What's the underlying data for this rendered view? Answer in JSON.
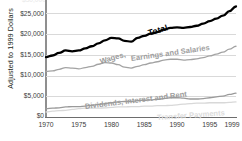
{
  "chart_data": {
    "type": "line",
    "title": "",
    "xlabel": "",
    "ylabel": "Adjusted to 1999 Dollars",
    "xlim": [
      1970,
      1999
    ],
    "ylim": [
      0,
      27000
    ],
    "grid": true,
    "legend_position": "inline-labels",
    "x_ticks": [
      "1970",
      "1975",
      "1980",
      "1985",
      "1990",
      "1995",
      "1999"
    ],
    "x_tick_values": [
      1970,
      1975,
      1980,
      1985,
      1990,
      1995,
      1999
    ],
    "y_ticks": [
      "$0",
      "$5,000",
      "$10,000",
      "$15,000",
      "$20,000",
      "$25,000"
    ],
    "y_tick_values": [
      0,
      5000,
      10000,
      15000,
      20000,
      25000
    ],
    "x": [
      1970,
      1971,
      1972,
      1973,
      1974,
      1975,
      1976,
      1977,
      1978,
      1979,
      1980,
      1981,
      1982,
      1983,
      1984,
      1985,
      1986,
      1987,
      1988,
      1989,
      1990,
      1991,
      1992,
      1993,
      1994,
      1995,
      1996,
      1997,
      1998,
      1999
    ],
    "series": [
      {
        "name": "Total",
        "color": "#000000",
        "width": 2.3,
        "values": [
          14300,
          14700,
          15300,
          15900,
          15700,
          15900,
          16400,
          16900,
          17600,
          18300,
          18900,
          18800,
          18200,
          18000,
          18900,
          19400,
          19900,
          20300,
          20900,
          21300,
          21400,
          21300,
          21500,
          21800,
          22300,
          22900,
          23500,
          24200,
          25300,
          26400
        ]
      },
      {
        "name": "Wages, Earnings and Salaries",
        "color": "#a3a3a3",
        "width": 1.3,
        "values": [
          10900,
          11000,
          11400,
          11800,
          11700,
          11500,
          11800,
          12100,
          12600,
          13000,
          12900,
          12500,
          11900,
          11700,
          12100,
          12500,
          12900,
          13200,
          13600,
          13800,
          13800,
          13600,
          13700,
          13900,
          14200,
          14600,
          15000,
          15500,
          16200,
          16900
        ]
      },
      {
        "name": "Dividends, Interest and Rent",
        "color": "#9a9a9a",
        "width": 1.3,
        "values": [
          2000,
          2100,
          2200,
          2400,
          2500,
          2500,
          2600,
          2800,
          3000,
          3200,
          3400,
          3600,
          3700,
          3700,
          3900,
          4000,
          4100,
          4200,
          4400,
          4600,
          4600,
          4500,
          4300,
          4300,
          4400,
          4600,
          4800,
          5000,
          5400,
          5700
        ]
      },
      {
        "name": "Transfer Payments",
        "color": "#d8d8d8",
        "width": 1.3,
        "values": [
          1200,
          1400,
          1500,
          1600,
          1800,
          2000,
          2100,
          2100,
          2100,
          2200,
          2300,
          2400,
          2400,
          2500,
          2500,
          2600,
          2600,
          2700,
          2700,
          2800,
          2900,
          3100,
          3200,
          3300,
          3300,
          3400,
          3400,
          3400,
          3500,
          3600
        ]
      }
    ],
    "annotations": [
      {
        "text": "Total",
        "series": "Total"
      },
      {
        "text": "Wages,",
        "series": "Wages, Earnings and Salaries"
      },
      {
        "text": "Earnings and Salaries",
        "series": "Wages, Earnings and Salaries"
      },
      {
        "text": "Dividends, Interest and Rent",
        "series": "Dividends, Interest and Rent"
      },
      {
        "text": "Transfer Payments",
        "series": "Transfer Payments"
      }
    ],
    "clipped_top_label": "$30,000"
  }
}
